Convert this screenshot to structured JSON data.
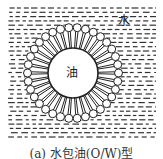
{
  "diagram": {
    "type": "oil-in-water emulsion micelle",
    "labels": {
      "water": "水",
      "oil": "油"
    },
    "caption": "(a) 水包油(O/W)型",
    "geometry": {
      "field": {
        "x": 8,
        "y": 8,
        "w": 148,
        "h": 129
      },
      "center": {
        "x": 73,
        "y": 73
      },
      "oil_radius": 25,
      "tail_end_radius": 42,
      "head_radius": 4,
      "surfactant_count": 34
    },
    "colors": {
      "line": "#222222",
      "background": "#ffffff"
    }
  }
}
